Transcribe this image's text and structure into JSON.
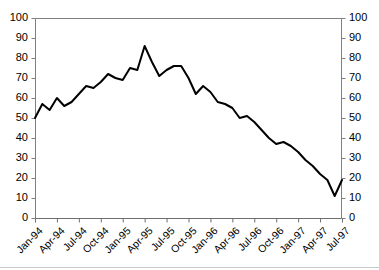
{
  "title_strip": "",
  "chart_data": {
    "type": "line",
    "title": "",
    "subtitle": "",
    "xlabel": "",
    "ylabel": "",
    "ylim": [
      0,
      100
    ],
    "y_ticks": [
      0,
      10,
      20,
      30,
      40,
      50,
      60,
      70,
      80,
      90,
      100
    ],
    "y_ticks_right": [
      0,
      10,
      20,
      30,
      40,
      50,
      60,
      70,
      80,
      90,
      100
    ],
    "grid": false,
    "legend": "none",
    "dual_y_axis": true,
    "line_color": "#000000",
    "axis_color": "#808080",
    "x_tick_labels": [
      "Jan-94",
      "Apr-94",
      "Jul-94",
      "Oct-94",
      "Jan-95",
      "Apr-95",
      "Jul-95",
      "Oct-95",
      "Jan-96",
      "Apr-96",
      "Jul-96",
      "Oct-96",
      "Jan-97",
      "Apr-97",
      "Jul-97"
    ],
    "x": [
      "Jan-94",
      "Feb-94",
      "Mar-94",
      "Apr-94",
      "May-94",
      "Jun-94",
      "Jul-94",
      "Aug-94",
      "Sep-94",
      "Oct-94",
      "Nov-94",
      "Dec-94",
      "Jan-95",
      "Feb-95",
      "Mar-95",
      "Apr-95",
      "May-95",
      "Jun-95",
      "Jul-95",
      "Aug-95",
      "Sep-95",
      "Oct-95",
      "Nov-95",
      "Dec-95",
      "Jan-96",
      "Feb-96",
      "Mar-96",
      "Apr-96",
      "May-96",
      "Jun-96",
      "Jul-96",
      "Aug-96",
      "Sep-96",
      "Oct-96",
      "Nov-96",
      "Dec-96",
      "Jan-97",
      "Feb-97",
      "Mar-97",
      "Apr-97",
      "May-97",
      "Jun-97",
      "Jul-97"
    ],
    "series": [
      {
        "name": "Series 1",
        "values": [
          50,
          57,
          54,
          60,
          56,
          58,
          62,
          66,
          65,
          68,
          72,
          70,
          69,
          75,
          74,
          86,
          78,
          71,
          74,
          76,
          76,
          70,
          62,
          66,
          63,
          58,
          57,
          55,
          50,
          51,
          48,
          44,
          40,
          37,
          38,
          36,
          33,
          29,
          26,
          22,
          19,
          11,
          19
        ]
      }
    ],
    "x_count": 43,
    "point_markers": false,
    "line_width": 2
  },
  "plot_geometry": {
    "left": 35,
    "right": 342,
    "top": 18,
    "bottom": 218
  }
}
